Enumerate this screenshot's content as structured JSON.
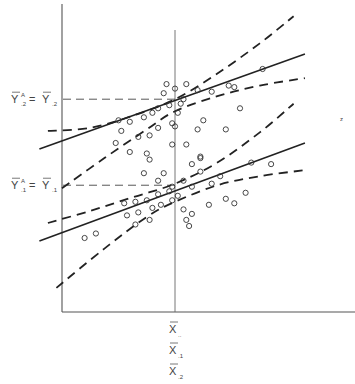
{
  "chart_data": {
    "type": "scatter",
    "title": "",
    "xlabel": "",
    "ylabel": "",
    "grid": false,
    "x_range": [
      0,
      10
    ],
    "y_range": [
      0,
      10
    ],
    "x_mean_reference": 4.0,
    "x_labels": [
      {
        "base": "X",
        "sub": "..",
        "name": "grand-mean"
      },
      {
        "base": "X",
        "sub": ".1",
        "name": "group-1-mean"
      },
      {
        "base": "X",
        "sub": ".2",
        "name": "group-2-mean"
      }
    ],
    "y_labels": [
      {
        "lhs": "Y",
        "lhs_sup": "A",
        "lhs_sub": ".2",
        "rhs": "Y",
        "rhs_sub": ".2",
        "y": 7.05,
        "name": "adjusted-mean-group-2"
      },
      {
        "lhs": "Y",
        "lhs_sup": "A",
        "lhs_sub": ".1",
        "rhs": "Y",
        "rhs_sub": ".1",
        "y": 4.2,
        "name": "adjusted-mean-group-1"
      }
    ],
    "series": [
      {
        "name": "group-2",
        "regression": {
          "x0": -0.8,
          "y0": 5.4,
          "x1": 8.6,
          "y1": 8.55
        },
        "upper_band": [
          [
            -0.5,
            6.0
          ],
          [
            1.0,
            6.1
          ],
          [
            2.5,
            6.5
          ],
          [
            4.0,
            7.05
          ],
          [
            5.5,
            7.9
          ],
          [
            7.0,
            8.9
          ],
          [
            8.2,
            9.8
          ]
        ],
        "lower_band": [
          [
            0.0,
            4.1
          ],
          [
            1.5,
            5.1
          ],
          [
            3.0,
            6.05
          ],
          [
            4.0,
            6.65
          ],
          [
            5.5,
            7.15
          ],
          [
            7.0,
            7.5
          ],
          [
            8.6,
            7.75
          ]
        ],
        "points": [
          [
            2.0,
            6.35
          ],
          [
            2.4,
            6.3
          ],
          [
            2.9,
            6.45
          ],
          [
            3.2,
            6.6
          ],
          [
            3.4,
            6.75
          ],
          [
            3.8,
            6.85
          ],
          [
            4.2,
            6.9
          ],
          [
            1.9,
            5.6
          ],
          [
            2.1,
            6.0
          ],
          [
            2.7,
            5.8
          ],
          [
            3.1,
            5.85
          ],
          [
            3.4,
            6.1
          ],
          [
            3.9,
            6.25
          ],
          [
            4.1,
            6.6
          ],
          [
            2.4,
            5.3
          ],
          [
            3.0,
            5.25
          ],
          [
            4.4,
            5.55
          ],
          [
            4.8,
            6.05
          ],
          [
            5.0,
            6.35
          ],
          [
            5.8,
            6.05
          ],
          [
            6.3,
            6.75
          ],
          [
            3.6,
            7.25
          ],
          [
            3.7,
            7.55
          ],
          [
            4.0,
            7.4
          ],
          [
            4.4,
            7.55
          ],
          [
            4.8,
            7.35
          ],
          [
            5.3,
            7.3
          ],
          [
            5.9,
            7.5
          ],
          [
            6.1,
            7.45
          ],
          [
            4.3,
            7.05
          ],
          [
            4.0,
            6.15
          ],
          [
            4.9,
            5.1
          ],
          [
            7.1,
            8.05
          ]
        ]
      },
      {
        "name": "group-1",
        "regression": {
          "x0": -0.8,
          "y0": 2.35,
          "x1": 8.6,
          "y1": 5.6
        },
        "upper_band": [
          [
            -0.5,
            2.95
          ],
          [
            1.0,
            3.35
          ],
          [
            2.5,
            3.8
          ],
          [
            4.0,
            4.25
          ],
          [
            5.5,
            4.95
          ],
          [
            7.0,
            5.95
          ],
          [
            8.2,
            6.9
          ]
        ],
        "lower_band": [
          [
            -0.2,
            0.8
          ],
          [
            1.5,
            2.1
          ],
          [
            3.0,
            3.15
          ],
          [
            4.0,
            3.65
          ],
          [
            5.5,
            4.2
          ],
          [
            7.0,
            4.5
          ],
          [
            8.6,
            4.7
          ]
        ],
        "points": [
          [
            0.8,
            2.45
          ],
          [
            1.2,
            2.6
          ],
          [
            2.2,
            3.6
          ],
          [
            2.6,
            3.65
          ],
          [
            3.0,
            3.7
          ],
          [
            3.4,
            3.9
          ],
          [
            3.8,
            4.0
          ],
          [
            2.3,
            3.2
          ],
          [
            2.7,
            3.3
          ],
          [
            3.2,
            3.45
          ],
          [
            3.5,
            3.55
          ],
          [
            3.9,
            3.7
          ],
          [
            4.1,
            3.85
          ],
          [
            2.6,
            2.9
          ],
          [
            3.1,
            3.05
          ],
          [
            3.4,
            4.35
          ],
          [
            3.6,
            4.6
          ],
          [
            3.9,
            4.15
          ],
          [
            4.3,
            3.4
          ],
          [
            4.6,
            3.25
          ],
          [
            4.3,
            4.35
          ],
          [
            4.6,
            4.15
          ],
          [
            4.9,
            4.65
          ],
          [
            5.3,
            4.25
          ],
          [
            5.6,
            4.5
          ],
          [
            5.2,
            3.55
          ],
          [
            5.8,
            3.75
          ],
          [
            6.1,
            3.6
          ],
          [
            4.4,
            3.05
          ],
          [
            4.5,
            2.85
          ],
          [
            6.5,
            3.95
          ],
          [
            3.1,
            5.05
          ],
          [
            2.9,
            4.6
          ],
          [
            3.9,
            5.55
          ],
          [
            4.6,
            4.9
          ],
          [
            4.9,
            5.15
          ],
          [
            6.7,
            4.95
          ],
          [
            7.4,
            4.9
          ]
        ]
      }
    ]
  },
  "annotations": {
    "stray_mark": "z"
  }
}
